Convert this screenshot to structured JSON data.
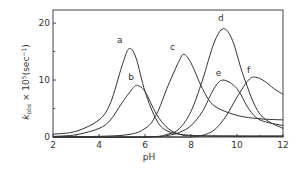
{
  "chart_data": {
    "type": "line",
    "title": "",
    "xlabel": "pH",
    "ylabel": "k_obs × 10^5 (sec^-1)",
    "xlim": [
      2,
      12
    ],
    "ylim": [
      0,
      22
    ],
    "xticks": [
      2,
      4,
      6,
      8,
      10,
      12
    ],
    "yticks": [
      0,
      10,
      20
    ],
    "xtick_labels": [
      "2",
      "4",
      "6",
      "8",
      "10",
      "12"
    ],
    "ytick_labels": [
      "0",
      "10",
      "20"
    ],
    "grid": false,
    "legend": "curve labels inline",
    "series": [
      {
        "name": "a",
        "peak_x": 5.3,
        "peak_y": 15.5,
        "x": [
          2,
          3,
          4,
          4.5,
          5,
          5.3,
          5.6,
          6,
          6.5,
          7,
          8,
          10,
          12
        ],
        "y": [
          0.5,
          1,
          3,
          6,
          12.5,
          15.5,
          14,
          8,
          3,
          1,
          0.3,
          0.2,
          0.2
        ]
      },
      {
        "name": "b",
        "peak_x": 5.7,
        "peak_y": 9,
        "x": [
          2,
          3,
          4,
          4.5,
          5,
          5.5,
          5.7,
          6,
          6.5,
          7,
          7.5,
          8,
          10,
          12
        ],
        "y": [
          0.1,
          0.4,
          1.5,
          3,
          6,
          8.7,
          9,
          8,
          4,
          1.5,
          0.5,
          0.2,
          0.1,
          0.1
        ]
      },
      {
        "name": "c",
        "peak_x": 7.7,
        "peak_y": 14.5,
        "x": [
          2,
          5,
          6,
          6.5,
          7,
          7.5,
          7.7,
          8,
          8.5,
          9,
          10,
          11,
          12
        ],
        "y": [
          0,
          0.3,
          1.5,
          4,
          9,
          13.5,
          14.5,
          13,
          8.5,
          5.5,
          3.8,
          3.2,
          3
        ]
      },
      {
        "name": "d",
        "peak_x": 9.4,
        "peak_y": 19,
        "x": [
          2,
          6,
          7,
          7.5,
          8,
          8.5,
          9,
          9.4,
          9.8,
          10.3,
          11,
          12
        ],
        "y": [
          0,
          0,
          0.5,
          1.5,
          4.5,
          10,
          16.5,
          19,
          17,
          10.5,
          4,
          1.5
        ]
      },
      {
        "name": "e",
        "peak_x": 9.4,
        "peak_y": 10,
        "x": [
          2,
          6,
          7,
          7.5,
          8,
          8.5,
          9,
          9.4,
          10,
          10.5,
          11,
          12
        ],
        "y": [
          0,
          0,
          0.3,
          0.8,
          2,
          4.5,
          8.5,
          10,
          8.5,
          5,
          3,
          2
        ]
      },
      {
        "name": "f",
        "peak_x": 10.8,
        "peak_y": 10.5,
        "x": [
          2,
          7,
          8,
          8.5,
          9,
          9.5,
          10,
          10.5,
          10.8,
          11.2,
          11.6,
          12
        ],
        "y": [
          0,
          0,
          0,
          0.3,
          1.2,
          3.5,
          7,
          10,
          10.5,
          9.8,
          8.5,
          7.5
        ]
      }
    ],
    "annotations": [
      "a",
      "b",
      "c",
      "d",
      "e",
      "f"
    ]
  }
}
